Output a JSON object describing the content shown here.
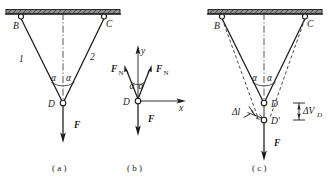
{
  "figure": {
    "panels": [
      {
        "id": "a",
        "caption": "( a )",
        "nodes": {
          "left": "B",
          "right": "C",
          "bottom": "D"
        },
        "members": {
          "left": "1",
          "right": "2"
        },
        "angles": {
          "left": "α",
          "right": "α"
        },
        "load": "F"
      },
      {
        "id": "b",
        "caption": "( b )",
        "origin": "D",
        "axes": {
          "x": "x",
          "y": "y"
        },
        "forces": {
          "left": "F",
          "right": "F",
          "load": "F"
        },
        "force_subscript": "N",
        "angles": {
          "left": "α",
          "right": "α"
        }
      },
      {
        "id": "c",
        "caption": "( c )",
        "nodes": {
          "left": "B",
          "right": "C",
          "bottom": "D",
          "displaced": "D′"
        },
        "angles": {
          "left": "α",
          "right": "α"
        },
        "elongation": "Δl",
        "displacement_prefix": "ΔV",
        "displacement_subscript": "D",
        "load": "F"
      }
    ]
  },
  "colors": {
    "ink": "#1a1a1a",
    "support_fill": "#8d8d8d",
    "dash": "#2b2b2b",
    "background": "#ffffff"
  }
}
